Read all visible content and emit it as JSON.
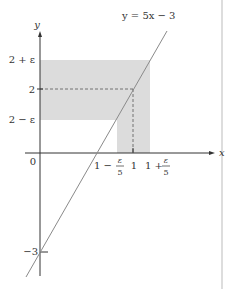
{
  "diagram": {
    "equation_label": "y = 5x − 3",
    "axes": {
      "x_label": "x",
      "y_label": "y",
      "origin_label": "0"
    },
    "y_ticks": {
      "upper": "2 + ε",
      "center": "2",
      "lower": "2 − ε",
      "intercept": "−3"
    },
    "x_ticks": {
      "left_prefix": "1 −",
      "left_frac_num": "ε",
      "left_frac_den": "5",
      "center": "1",
      "right_prefix": "1 +",
      "right_frac_num": "ε",
      "right_frac_den": "5"
    },
    "colors": {
      "shade": "#dcdcdc",
      "line": "#8a8a8a",
      "axis": "#333333",
      "dash": "#555555",
      "border": "#bbbbbb"
    }
  }
}
